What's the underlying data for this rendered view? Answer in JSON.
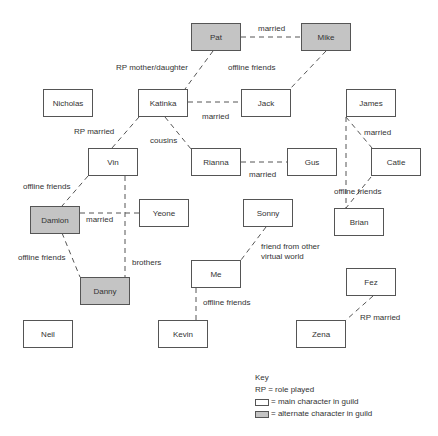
{
  "colors": {
    "main_fill": "#ffffff",
    "alt_fill": "#c4c4c4",
    "border": "#555555",
    "line": "#555555"
  },
  "nodes": {
    "pat": {
      "label": "Pat",
      "type": "alternate",
      "x": 191,
      "y": 23
    },
    "mike": {
      "label": "Mike",
      "type": "alternate",
      "x": 301,
      "y": 23
    },
    "nicholas": {
      "label": "Nicholas",
      "type": "main",
      "x": 43,
      "y": 89
    },
    "katinka": {
      "label": "Katinka",
      "type": "main",
      "x": 138,
      "y": 89
    },
    "jack": {
      "label": "Jack",
      "type": "main",
      "x": 241,
      "y": 89
    },
    "james": {
      "label": "James",
      "type": "main",
      "x": 346,
      "y": 89
    },
    "vin": {
      "label": "Vin",
      "type": "main",
      "x": 88,
      "y": 148
    },
    "rianna": {
      "label": "Rianna",
      "type": "main",
      "x": 191,
      "y": 148
    },
    "gus": {
      "label": "Gus",
      "type": "main",
      "x": 287,
      "y": 148
    },
    "catie": {
      "label": "Catie",
      "type": "main",
      "x": 371,
      "y": 148
    },
    "damion": {
      "label": "Damion",
      "type": "alternate",
      "x": 30,
      "y": 206
    },
    "yeone": {
      "label": "Yeone",
      "type": "main",
      "x": 139,
      "y": 199
    },
    "sonny": {
      "label": "Sonny",
      "type": "main",
      "x": 243,
      "y": 199
    },
    "brian": {
      "label": "Brian",
      "type": "main",
      "x": 334,
      "y": 208
    },
    "me": {
      "label": "Me",
      "type": "main",
      "x": 191,
      "y": 260
    },
    "fez": {
      "label": "Fez",
      "type": "main",
      "x": 346,
      "y": 268
    },
    "danny": {
      "label": "Danny",
      "type": "alternate",
      "x": 80,
      "y": 277
    },
    "neil": {
      "label": "Neil",
      "type": "main",
      "x": 23,
      "y": 320
    },
    "kevin": {
      "label": "Kevin",
      "type": "main",
      "x": 158,
      "y": 320
    },
    "zena": {
      "label": "Zena",
      "type": "main",
      "x": 296,
      "y": 320
    }
  },
  "edges": [
    {
      "from": "pat",
      "to": "mike",
      "label": "married",
      "x1": 241,
      "y1": 37,
      "x2": 301,
      "y2": 37,
      "lx": 258,
      "ly": 24
    },
    {
      "from": "pat",
      "to": "katinka",
      "label": "RP mother/daughter",
      "x1": 213,
      "y1": 51,
      "x2": 185,
      "y2": 89,
      "lx": 116,
      "ly": 63
    },
    {
      "from": "mike",
      "to": "jack",
      "label": "offline friends",
      "x1": 326,
      "y1": 51,
      "x2": 290,
      "y2": 89,
      "lx": 228,
      "ly": 63
    },
    {
      "from": "katinka",
      "to": "jack",
      "label": "married",
      "x1": 188,
      "y1": 102,
      "x2": 241,
      "y2": 102,
      "lx": 202,
      "ly": 112
    },
    {
      "from": "katinka",
      "to": "vin",
      "label": "RP married",
      "x1": 139,
      "y1": 117,
      "x2": 112,
      "y2": 148,
      "lx": 74,
      "ly": 127
    },
    {
      "from": "katinka",
      "to": "rianna",
      "label": "cousins",
      "x1": 165,
      "y1": 117,
      "x2": 191,
      "y2": 149,
      "lx": 150,
      "ly": 136
    },
    {
      "from": "rianna",
      "to": "gus",
      "label": "married",
      "x1": 241,
      "y1": 162,
      "x2": 287,
      "y2": 162,
      "lx": 249,
      "ly": 170
    },
    {
      "from": "vin",
      "to": "damion",
      "label": "offline friends",
      "x1": 88,
      "y1": 176,
      "x2": 62,
      "y2": 206,
      "lx": 23,
      "ly": 182
    },
    {
      "from": "damion",
      "to": "yeone",
      "label": "married",
      "x1": 80,
      "y1": 213,
      "x2": 139,
      "y2": 213,
      "lx": 86,
      "ly": 215
    },
    {
      "from": "vin",
      "to": "danny",
      "label": "brothers",
      "x1": 125,
      "y1": 176,
      "x2": 125,
      "y2": 277,
      "lx": 132,
      "ly": 258
    },
    {
      "from": "damion",
      "to": "danny",
      "label": "offline friends",
      "x1": 62,
      "y1": 233,
      "x2": 80,
      "y2": 277,
      "lx": 18,
      "ly": 253
    },
    {
      "from": "james",
      "to": "catie",
      "label": "married",
      "x1": 346,
      "y1": 117,
      "x2": 372,
      "y2": 148,
      "lx": 364,
      "ly": 128
    },
    {
      "from": "james",
      "to": "brian",
      "label": "",
      "x1": 346,
      "y1": 117,
      "x2": 346,
      "y2": 208,
      "lx": 0,
      "ly": 0
    },
    {
      "from": "catie",
      "to": "brian",
      "label": "offline friends",
      "x1": 371,
      "y1": 177,
      "x2": 346,
      "y2": 208,
      "lx": 334,
      "ly": 187
    },
    {
      "from": "sonny",
      "to": "me",
      "label": "friend from other virtual world",
      "x1": 266,
      "y1": 227,
      "x2": 241,
      "y2": 260,
      "lx": 261,
      "ly": 242
    },
    {
      "from": "me",
      "to": "kevin",
      "label": "offline friends",
      "x1": 196,
      "y1": 288,
      "x2": 196,
      "y2": 320,
      "lx": 203,
      "ly": 298
    },
    {
      "from": "fez",
      "to": "zena",
      "label": "RP married",
      "x1": 373,
      "y1": 296,
      "x2": 346,
      "y2": 320,
      "lx": 360,
      "ly": 313
    }
  ],
  "key": {
    "title": "Key",
    "rp": "RP = role played",
    "main": "= main character in guild",
    "alternate": "= alternate character in guild"
  }
}
